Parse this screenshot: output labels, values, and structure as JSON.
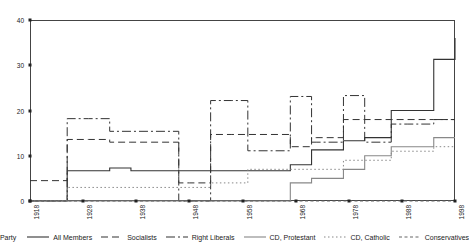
{
  "chart_data": {
    "type": "line",
    "title": "",
    "subtitle": "",
    "xlabel": "",
    "ylabel": "",
    "xlim": [
      1918,
      1998
    ],
    "ylim": [
      0,
      40
    ],
    "grid": false,
    "legend_position": "bottom",
    "legend_title": "Party",
    "x_ticks": [
      1918,
      1928,
      1938,
      1948,
      1958,
      1968,
      1978,
      1988,
      1998
    ],
    "x_tick_labels": [
      "1918",
      "1928",
      "1938",
      "1948",
      "1958",
      "1968",
      "1978",
      "1988",
      "1998"
    ],
    "y_ticks": [
      0,
      10,
      20,
      30,
      40
    ],
    "y_tick_labels": [
      "0",
      "10",
      "20",
      "30",
      "40"
    ],
    "x": [
      1918,
      1922,
      1925,
      1929,
      1933,
      1937,
      1946,
      1948,
      1952,
      1956,
      1959,
      1963,
      1967,
      1971,
      1972,
      1977,
      1981,
      1982,
      1986,
      1989,
      1994,
      1998
    ],
    "series": [
      {
        "name": "All Members",
        "style": "solid",
        "color": "#333333",
        "values": [
          0,
          0,
          6.7,
          6.7,
          7.3,
          6.7,
          6.7,
          6.7,
          6.7,
          6.7,
          6.7,
          6.7,
          8.0,
          11.3,
          11.3,
          13.3,
          14.0,
          14.0,
          20.0,
          20.0,
          31.3,
          36.0
        ]
      },
      {
        "name": "Socialists",
        "style": "dashed",
        "color": "#333333",
        "values": [
          4.5,
          4.5,
          13.6,
          13.6,
          13.0,
          13.0,
          4.0,
          4.0,
          14.7,
          14.7,
          14.7,
          14.7,
          12.0,
          14.0,
          14.0,
          18.0,
          18.0,
          18.0,
          18.0,
          18.0,
          18.0,
          18.0
        ]
      },
      {
        "name": "Right Liberals",
        "style": "dashdot",
        "color": "#333333",
        "values": [
          0,
          0,
          18.2,
          18.2,
          15.4,
          15.4,
          0,
          0,
          22.2,
          22.2,
          11.1,
          11.1,
          23.1,
          13.0,
          13.0,
          23.3,
          13.0,
          13.0,
          17.0,
          17.0,
          18.0,
          18.0
        ]
      },
      {
        "name": "CD, Protestant",
        "style": "solid",
        "color": "#888888",
        "values": [
          0,
          0,
          0,
          0,
          0,
          0,
          0,
          0,
          0,
          0,
          0,
          0,
          4.0,
          5.0,
          5.0,
          7.0,
          10.0,
          10.0,
          12.0,
          12.0,
          14.0,
          14.0
        ]
      },
      {
        "name": "CD, Catholic",
        "style": "dotted",
        "color": "#888888",
        "values": [
          0,
          0,
          3.0,
          3.0,
          3.0,
          3.0,
          3.0,
          3.0,
          4.0,
          4.0,
          7.0,
          7.0,
          7.0,
          7.0,
          7.0,
          9.0,
          9.0,
          9.0,
          11.0,
          11.0,
          12.0,
          12.0
        ]
      },
      {
        "name": "Conservatives",
        "style": "dashed-small",
        "color": "#666666",
        "values": [
          0,
          0,
          0,
          0,
          0,
          0,
          0,
          0,
          0,
          0,
          0,
          0,
          0,
          0,
          0,
          0,
          0,
          0,
          0,
          0,
          0,
          0
        ]
      }
    ]
  }
}
